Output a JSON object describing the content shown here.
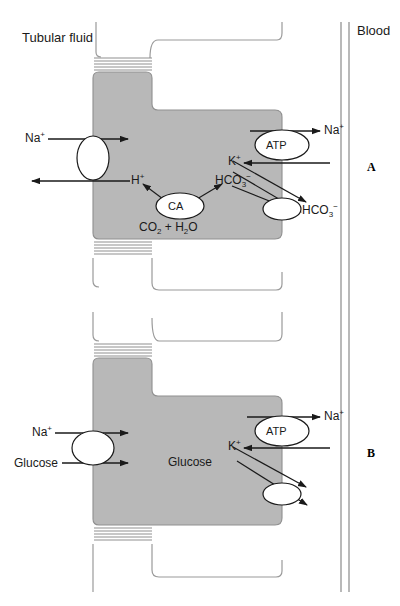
{
  "figure": {
    "type": "biological-diagram",
    "colors": {
      "cell_fill": "#b8b8b8",
      "cell_stroke": "#8f8f8f",
      "membrane_stroke": "#9a9a9a",
      "arrow": "#1a1a1a",
      "text": "#1a1a1a",
      "background": "#ffffff",
      "carrier_fill": "#ffffff"
    }
  },
  "labels": {
    "tubular_fluid": "Tubular fluid",
    "blood": "Blood",
    "panel_a": "A",
    "panel_b": "B"
  },
  "panel_a": {
    "letter": "A",
    "name": "proximal-tubule-bicarbonate-reabsorption",
    "apical": {
      "in_label": "Na",
      "in_charge": "+",
      "out_label": "H",
      "out_charge": "+",
      "carrier": "sodium-hydrogen-exchanger"
    },
    "cytosol": {
      "enzyme": "CA",
      "enzyme_name": "carbonic-anhydrase",
      "substrate_left": "CO",
      "substrate_sub": "2",
      "substrate_join": " + H",
      "substrate_sub2": "2",
      "substrate_tail": "O",
      "substrate_full": "CO2 + H2O",
      "product": "HCO",
      "product_sub": "3",
      "product_charge": "−",
      "product_full": "HCO3−"
    },
    "basolateral": {
      "pump": "ATP",
      "pump_name": "sodium-potassium-atpase",
      "out_na": "Na",
      "out_na_charge": "+",
      "in_k": "K",
      "in_k_charge": "+",
      "out_hco3": "HCO",
      "out_hco3_sub": "3",
      "out_hco3_charge": "−",
      "carrier": "bicarbonate-transporter"
    }
  },
  "panel_b": {
    "letter": "B",
    "name": "proximal-tubule-glucose-reabsorption",
    "apical": {
      "in_na": "Na",
      "in_na_charge": "+",
      "in_glucose": "Glucose",
      "carrier": "sodium-glucose-cotransporter"
    },
    "basolateral": {
      "pump": "ATP",
      "pump_name": "sodium-potassium-atpase",
      "out_na": "Na",
      "out_na_charge": "+",
      "in_k": "K",
      "in_k_charge": "+",
      "out_glucose": "Glucose",
      "carrier": "glucose-transporter"
    }
  }
}
